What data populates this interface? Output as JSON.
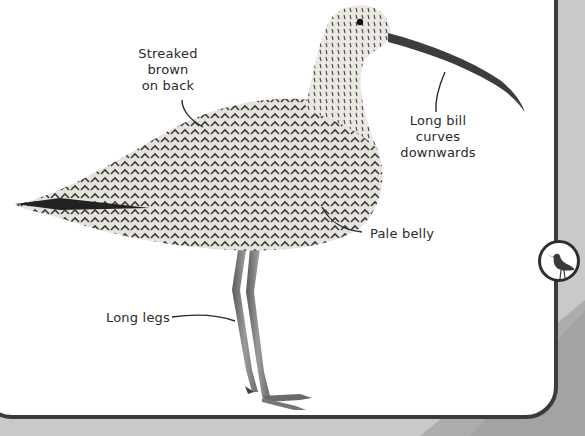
{
  "labels": {
    "back": [
      "Streaked brown",
      "on back"
    ],
    "bill": [
      "Long bill",
      "curves",
      "downwards"
    ],
    "belly": "Pale belly",
    "legs": "Long legs"
  },
  "icons": {
    "badge": "wader-bird-icon"
  },
  "colors": {
    "background": "#c9c9c9",
    "band": "#a9a9a9",
    "card": "#ffffff",
    "border": "#3b3b3b",
    "text": "#2a2a2a"
  }
}
